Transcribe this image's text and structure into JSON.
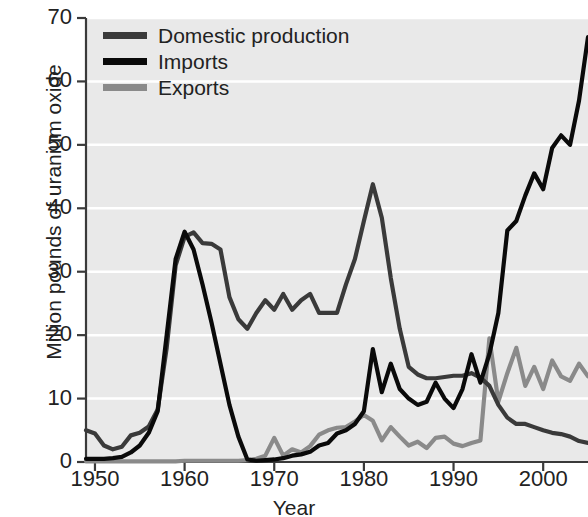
{
  "chart_data": {
    "type": "line",
    "title": "",
    "xlabel": "Year",
    "ylabel": "Million pounds of uranium oxide",
    "xlim": [
      1949,
      2005
    ],
    "ylim": [
      0,
      70
    ],
    "grid": true,
    "legend_position": "top-left",
    "xticks": [
      1950,
      1960,
      1970,
      1980,
      1990,
      2000
    ],
    "xtick_labels": [
      "1950",
      "1960",
      "1970",
      "1980",
      "1990",
      "2000"
    ],
    "yticks": [
      0,
      10,
      20,
      30,
      40,
      50,
      60,
      70
    ],
    "ytick_labels": [
      "0",
      "10",
      "20",
      "30",
      "40",
      "50",
      "60",
      "70"
    ],
    "x": [
      1949,
      1950,
      1951,
      1952,
      1953,
      1954,
      1955,
      1956,
      1957,
      1958,
      1959,
      1960,
      1961,
      1962,
      1963,
      1964,
      1965,
      1966,
      1967,
      1968,
      1969,
      1970,
      1971,
      1972,
      1973,
      1974,
      1975,
      1976,
      1977,
      1978,
      1979,
      1980,
      1981,
      1982,
      1983,
      1984,
      1985,
      1986,
      1987,
      1988,
      1989,
      1990,
      1991,
      1992,
      1993,
      1994,
      1995,
      1996,
      1997,
      1998,
      1999,
      2000,
      2001,
      2002,
      2003,
      2004,
      2005
    ],
    "series": [
      {
        "name": "Domestic production",
        "color": "#3a3a3a",
        "values": [
          5.0,
          4.5,
          2.6,
          2.0,
          2.4,
          4.2,
          4.6,
          5.6,
          8.3,
          18.0,
          31.0,
          35.5,
          36.2,
          34.5,
          34.4,
          33.5,
          26.0,
          22.5,
          21.0,
          23.5,
          25.5,
          24.0,
          26.5,
          24.0,
          25.5,
          26.5,
          23.5,
          23.5,
          23.5,
          28.0,
          32.0,
          38.0,
          43.8,
          38.5,
          29.0,
          21.0,
          15.0,
          13.8,
          13.2,
          13.2,
          13.4,
          13.6,
          13.6,
          14.0,
          13.3,
          12.0,
          9.0,
          7.0,
          6.0,
          6.0,
          5.5,
          5.0,
          4.6,
          4.4,
          4.0,
          3.3,
          3.0
        ]
      },
      {
        "name": "Imports",
        "color": "#0a0a0a",
        "values": [
          0.5,
          0.5,
          0.5,
          0.6,
          0.8,
          1.5,
          2.6,
          4.6,
          8.0,
          20.0,
          32.0,
          36.3,
          33.5,
          28.0,
          22.0,
          15.5,
          9.0,
          4.0,
          0.4,
          0.2,
          0.3,
          0.4,
          0.6,
          1.0,
          1.2,
          1.6,
          2.6,
          3.0,
          4.5,
          5.0,
          6.0,
          8.0,
          17.8,
          11.0,
          15.5,
          11.5,
          10.0,
          9.0,
          9.5,
          12.5,
          10.0,
          8.5,
          11.5,
          17.0,
          12.5,
          17.0,
          23.5,
          36.5,
          38.0,
          42.0,
          45.5,
          43.0,
          49.5,
          51.5,
          50.0,
          57.0,
          67.0
        ]
      },
      {
        "name": "Exports",
        "color": "#8a8a8a",
        "values": [
          0.1,
          0.1,
          0.1,
          0.1,
          0.1,
          0.1,
          0.1,
          0.1,
          0.1,
          0.1,
          0.1,
          0.2,
          0.2,
          0.2,
          0.2,
          0.2,
          0.2,
          0.2,
          0.3,
          0.5,
          1.0,
          3.8,
          1.0,
          2.0,
          1.5,
          2.5,
          4.3,
          5.0,
          5.4,
          5.5,
          6.4,
          7.4,
          6.5,
          3.4,
          5.5,
          4.0,
          2.6,
          3.2,
          2.2,
          3.8,
          4.0,
          2.9,
          2.5,
          3.0,
          3.4,
          19.5,
          9.5,
          14.0,
          18.0,
          12.0,
          15.0,
          11.5,
          16.0,
          13.5,
          12.8,
          15.5,
          13.5
        ]
      }
    ]
  },
  "legend": {
    "items": [
      {
        "label": "Domestic production",
        "color": "#3a3a3a"
      },
      {
        "label": "Imports",
        "color": "#0a0a0a"
      },
      {
        "label": "Exports",
        "color": "#8a8a8a"
      }
    ]
  }
}
